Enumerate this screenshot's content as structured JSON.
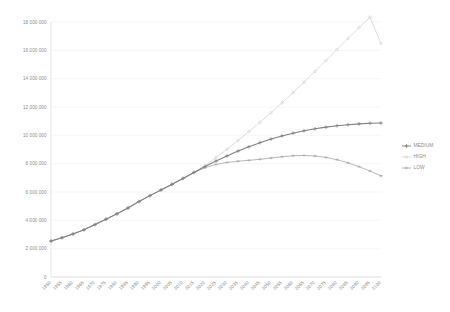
{
  "chart_data": {
    "type": "line",
    "title": "",
    "subtitle": "",
    "xlabel": "",
    "ylabel": "",
    "grid": true,
    "legend_position": "right",
    "ylim": [
      0,
      18000000
    ],
    "ytick_labels": [
      "0",
      "2 000 000",
      "4 000 000",
      "6 000 000",
      "8 000 000",
      "10 000 000",
      "12 000 000",
      "14 000 000",
      "16 000 000",
      "18 000 000"
    ],
    "ytick_values": [
      0,
      2000000,
      4000000,
      6000000,
      8000000,
      10000000,
      12000000,
      14000000,
      16000000,
      18000000
    ],
    "categories": [
      "1950",
      "1955",
      "1960",
      "1965",
      "1970",
      "1975",
      "1980",
      "1985",
      "1990",
      "1995",
      "2000",
      "2005",
      "2010",
      "2015",
      "2020",
      "2025",
      "2030",
      "2035",
      "2040",
      "2045",
      "2050",
      "2055",
      "2060",
      "2065",
      "2070",
      "2075",
      "2080",
      "2085",
      "2090",
      "2095",
      "2100"
    ],
    "series": [
      {
        "name": "MEDIUM",
        "color": "#808080",
        "marker": "plus",
        "values": [
          2536000,
          2773000,
          3035000,
          3335000,
          3700000,
          4079000,
          4458000,
          4871000,
          5327000,
          5744000,
          6143000,
          6542000,
          6957000,
          7380000,
          7795000,
          8184000,
          8548000,
          8888000,
          9199000,
          9482000,
          9735000,
          9958000,
          10152000,
          10318000,
          10459000,
          10577000,
          10674000,
          10750000,
          10810000,
          10852000,
          10875000
        ]
      },
      {
        "name": "HIGH",
        "color": "#d9d9d9",
        "marker": "circle",
        "values": [
          2536000,
          2773000,
          3035000,
          3335000,
          3700000,
          4079000,
          4458000,
          4871000,
          5327000,
          5744000,
          6143000,
          6542000,
          6957000,
          7380000,
          7870000,
          8428000,
          9022000,
          9636000,
          10268000,
          10920000,
          11594000,
          12290000,
          13010000,
          13752000,
          14512000,
          15284000,
          16060000,
          16840000,
          17600000,
          18340000,
          16480000
        ]
      },
      {
        "name": "LOW",
        "color": "#b0b0b0",
        "marker": "dash",
        "values": [
          2536000,
          2773000,
          3035000,
          3335000,
          3700000,
          4079000,
          4458000,
          4871000,
          5327000,
          5744000,
          6143000,
          6542000,
          6957000,
          7380000,
          7720000,
          7944000,
          8088000,
          8172000,
          8238000,
          8310000,
          8400000,
          8490000,
          8560000,
          8580000,
          8540000,
          8440000,
          8280000,
          8060000,
          7790000,
          7480000,
          7140000
        ]
      }
    ]
  },
  "legend": {
    "items": [
      {
        "label": "MEDIUM"
      },
      {
        "label": "HIGH"
      },
      {
        "label": "LOW"
      }
    ]
  }
}
